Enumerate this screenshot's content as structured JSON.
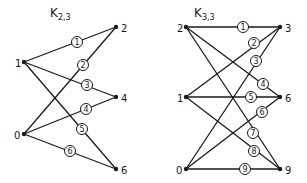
{
  "graphs": [
    {
      "id": "k23",
      "title": "K",
      "subscript": "2,3",
      "title_pos": [
        50,
        17
      ],
      "nodes": [
        {
          "id": "2",
          "x": 116,
          "y": 27,
          "label": "2",
          "lx": 121,
          "ly": 28
        },
        {
          "id": "1",
          "x": 24,
          "y": 62,
          "label": "1",
          "lx": 15,
          "ly": 63
        },
        {
          "id": "4",
          "x": 116,
          "y": 97,
          "label": "4",
          "lx": 121,
          "ly": 98
        },
        {
          "id": "0",
          "x": 24,
          "y": 134,
          "label": "0",
          "lx": 14,
          "ly": 135
        },
        {
          "id": "6",
          "x": 116,
          "y": 169,
          "label": "6",
          "lx": 121,
          "ly": 170
        }
      ],
      "edges": [
        {
          "from": "1",
          "to": "2",
          "label": "1",
          "lx": 77,
          "ly": 42
        },
        {
          "from": "0",
          "to": "2",
          "label": "2",
          "lx": 83,
          "ly": 65
        },
        {
          "from": "1",
          "to": "4",
          "label": "3",
          "lx": 87,
          "ly": 85
        },
        {
          "from": "0",
          "to": "4",
          "label": "4",
          "lx": 86,
          "ly": 109
        },
        {
          "from": "1",
          "to": "6",
          "label": "5",
          "lx": 82,
          "ly": 129
        },
        {
          "from": "0",
          "to": "6",
          "label": "6",
          "lx": 70,
          "ly": 151
        }
      ]
    },
    {
      "id": "k33",
      "title": "K",
      "subscript": "3,3",
      "title_pos": [
        194,
        17
      ],
      "nodes": [
        {
          "id": "2",
          "x": 186,
          "y": 27,
          "label": "2",
          "lx": 177,
          "ly": 28
        },
        {
          "id": "3",
          "x": 280,
          "y": 27,
          "label": "3",
          "lx": 285,
          "ly": 28
        },
        {
          "id": "1",
          "x": 186,
          "y": 97,
          "label": "1",
          "lx": 177,
          "ly": 98
        },
        {
          "id": "6",
          "x": 280,
          "y": 97,
          "label": "6",
          "lx": 285,
          "ly": 98
        },
        {
          "id": "0",
          "x": 186,
          "y": 169,
          "label": "0",
          "lx": 176,
          "ly": 170
        },
        {
          "id": "9",
          "x": 280,
          "y": 169,
          "label": "9",
          "lx": 285,
          "ly": 170
        }
      ],
      "edges": [
        {
          "from": "2",
          "to": "3",
          "label": "1",
          "lx": 243,
          "ly": 27
        },
        {
          "from": "1",
          "to": "3",
          "label": "2",
          "lx": 254,
          "ly": 43
        },
        {
          "from": "0",
          "to": "3",
          "label": "3",
          "lx": 256,
          "ly": 61
        },
        {
          "from": "2",
          "to": "6",
          "label": "4",
          "lx": 263,
          "ly": 84
        },
        {
          "from": "1",
          "to": "6",
          "label": "5",
          "lx": 251,
          "ly": 97
        },
        {
          "from": "0",
          "to": "6",
          "label": "6",
          "lx": 262,
          "ly": 112
        },
        {
          "from": "2",
          "to": "9",
          "label": "7",
          "lx": 253,
          "ly": 133
        },
        {
          "from": "1",
          "to": "9",
          "label": "8",
          "lx": 254,
          "ly": 151
        },
        {
          "from": "0",
          "to": "9",
          "label": "9",
          "lx": 245,
          "ly": 169
        }
      ]
    }
  ]
}
